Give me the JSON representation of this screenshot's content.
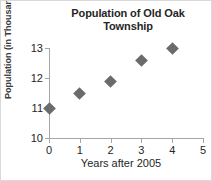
{
  "chart_data": {
    "type": "scatter",
    "title": "Population of Old Oak Township",
    "title_lines": [
      "Population of Old Oak",
      "Township"
    ],
    "xlabel": "Years after 2005",
    "ylabel": "Population (in Thousands)",
    "x": [
      0,
      1,
      2,
      3,
      4
    ],
    "values": [
      11,
      11.5,
      11.9,
      12.6,
      13
    ],
    "points": [
      {
        "x": 0,
        "y": 11
      },
      {
        "x": 1,
        "y": 11.5
      },
      {
        "x": 2,
        "y": 11.9
      },
      {
        "x": 3,
        "y": 12.6
      },
      {
        "x": 4,
        "y": 13
      }
    ],
    "xlim": [
      0,
      5
    ],
    "ylim": [
      10,
      13
    ],
    "xticks": [
      0,
      1,
      2,
      3,
      4,
      5
    ],
    "xtick_labels": [
      "0",
      "1",
      "2",
      "3",
      "4",
      "5"
    ],
    "yticks": [
      10,
      11,
      12,
      13
    ],
    "ytick_labels": [
      "10",
      "11",
      "12",
      "13"
    ],
    "grid": false,
    "legend": false,
    "marker": "diamond",
    "marker_color": "#6b6b6b",
    "axis_color": "#a6a6a6",
    "background": "#ffffff"
  }
}
